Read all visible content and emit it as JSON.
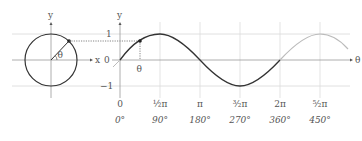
{
  "figure": {
    "colors": {
      "axis": "#888888",
      "grid": "#d8d8d8",
      "curve_main": "#333333",
      "curve_extended": "#bbbbbb",
      "text": "#555555",
      "projection": "#666666"
    },
    "circle": {
      "y_axis_label": "y",
      "x_axis_label": "x",
      "angle_label": "θ"
    },
    "sine": {
      "y_axis_label": "y",
      "x_axis_label": "θ",
      "theta_marker_label": "θ",
      "y_ticks": [
        {
          "label": "1",
          "value": 1
        },
        {
          "label": "0",
          "value": 0
        },
        {
          "label": "−1",
          "value": -1
        }
      ],
      "x_ticks_radian": [
        {
          "label": "0"
        },
        {
          "label": "½π"
        },
        {
          "label": "π"
        },
        {
          "label": "³⁄₂π"
        },
        {
          "label": "2π"
        },
        {
          "label": "⁵⁄₂π"
        }
      ],
      "x_ticks_degree": [
        {
          "label": "0°"
        },
        {
          "label": "90°"
        },
        {
          "label": "180°"
        },
        {
          "label": "270°"
        },
        {
          "label": "360°"
        },
        {
          "label": "450°"
        }
      ]
    }
  }
}
